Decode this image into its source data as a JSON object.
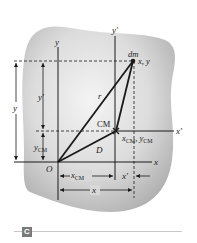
{
  "figure": {
    "panel_label": "C",
    "colors": {
      "body_fill_center": "#f2f2f2",
      "body_fill_edge": "#b5b5b5",
      "line": "#1a1a1a",
      "badge": "#7a7a7a",
      "rule": "#c8c8c8"
    },
    "axes": {
      "y": "y",
      "y_prime": "y′",
      "x": "x",
      "x_prime": "x′",
      "origin": "O"
    },
    "points": {
      "mass_element": "dm",
      "mass_element_coords": "x, y",
      "center_of_mass": "CM",
      "cm_coords_x": "x",
      "cm_coords_sub": "CM",
      "cm_coords_sep": ", ",
      "cm_coords_y": "y"
    },
    "vectors": {
      "r": "r",
      "D": "D"
    },
    "dimensions": {
      "y_total": "y",
      "y_prime": "y′",
      "y_cm_main": "y",
      "y_cm_sub": "CM",
      "x_cm_main": "x",
      "x_cm_sub": "CM",
      "x_prime": "x′",
      "x_total": "x"
    }
  }
}
